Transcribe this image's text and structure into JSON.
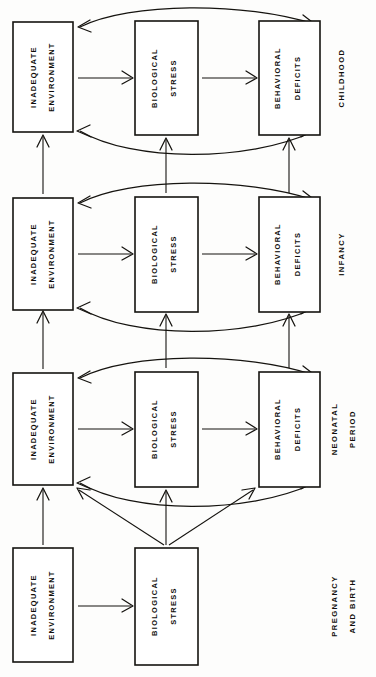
{
  "figure": {
    "orientation": "rotated-90",
    "background_color": "#fdfdfc",
    "ink_color": "#15130f"
  },
  "columns": [
    {
      "key": "environment",
      "label": "INADEQUATE ENVIRONMENT",
      "line1": "INADEQUATE",
      "line2": "ENVIRONMENT"
    },
    {
      "key": "stress",
      "label": "BIOLOGICAL STRESS",
      "line1": "BIOLOGICAL",
      "line2": "STRESS"
    },
    {
      "key": "deficits",
      "label": "BEHAVIORAL DEFICITS",
      "line1": "BEHAVIORAL",
      "line2": "DEFICITS"
    }
  ],
  "stages": [
    {
      "key": "childhood",
      "label_lines": [
        "CHILDHOOD"
      ],
      "boxes": [
        "INADEQUATE ENVIRONMENT",
        "BIOLOGICAL STRESS",
        "BEHAVIORAL DEFICITS"
      ]
    },
    {
      "key": "infancy",
      "label_lines": [
        "INFANCY"
      ],
      "boxes": [
        "INADEQUATE ENVIRONMENT",
        "BIOLOGICAL STRESS",
        "BEHAVIORAL DEFICITS"
      ]
    },
    {
      "key": "neonatal-period",
      "label_lines": [
        "NEONATAL",
        "PERIOD"
      ],
      "boxes": [
        "INADEQUATE ENVIRONMENT",
        "BIOLOGICAL STRESS",
        "BEHAVIORAL DEFICITS"
      ]
    },
    {
      "key": "pregnancy-and-birth",
      "label_lines": [
        "PREGNANCY",
        "AND BIRTH"
      ],
      "boxes": [
        "INADEQUATE ENVIRONMENT",
        "BIOLOGICAL STRESS"
      ]
    }
  ],
  "box_text": {
    "childhood": {
      "environment": {
        "line1": "INADEQUATE",
        "line2": "ENVIRONMENT"
      },
      "stress": {
        "line1": "BIOLOGICAL",
        "line2": "STRESS"
      },
      "deficits": {
        "line1": "BEHAVIORAL",
        "line2": "DEFICITS"
      }
    },
    "infancy": {
      "environment": {
        "line1": "INADEQUATE",
        "line2": "ENVIRONMENT"
      },
      "stress": {
        "line1": "BIOLOGICAL",
        "line2": "STRESS"
      },
      "deficits": {
        "line1": "BEHAVIORAL",
        "line2": "DEFICITS"
      }
    },
    "neonatal": {
      "environment": {
        "line1": "INADEQUATE",
        "line2": "ENVIRONMENT"
      },
      "stress": {
        "line1": "BIOLOGICAL",
        "line2": "STRESS"
      },
      "deficits": {
        "line1": "BEHAVIORAL",
        "line2": "DEFICITS"
      }
    },
    "pregnancy": {
      "environment": {
        "line1": "INADEQUATE",
        "line2": "ENVIRONMENT"
      },
      "stress": {
        "line1": "BIOLOGICAL",
        "line2": "STRESS"
      }
    }
  },
  "stage_labels": {
    "childhood": {
      "line1": "CHILDHOOD",
      "line2": ""
    },
    "infancy": {
      "line1": "INFANCY",
      "line2": ""
    },
    "neonatal": {
      "line1": "NEONATAL",
      "line2": "PERIOD"
    },
    "pregnancy": {
      "line1": "PREGNANCY",
      "line2": "AND BIRTH"
    }
  }
}
